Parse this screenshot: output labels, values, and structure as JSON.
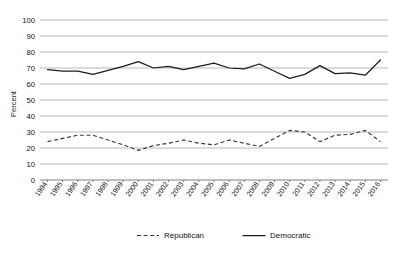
{
  "chart_data": {
    "type": "line",
    "title": "",
    "xlabel": "",
    "ylabel": "Percent",
    "ylim": [
      0,
      100
    ],
    "ytick_step": 10,
    "yticks": [
      "0",
      "10",
      "20",
      "30",
      "40",
      "50",
      "60",
      "70",
      "80",
      "90",
      "100"
    ],
    "grid": true,
    "legend_position": "bottom",
    "categories": [
      "1994",
      "1995",
      "1996",
      "1997",
      "1998",
      "1999",
      "2000",
      "2001",
      "2002",
      "2003",
      "2004",
      "2005",
      "2006",
      "2007",
      "2008",
      "2009",
      "2010",
      "2011",
      "2012",
      "2013",
      "2014",
      "2015",
      "2016"
    ],
    "series": [
      {
        "name": "Republican",
        "style": "dashed",
        "color": "#3a3a3a",
        "values": [
          24,
          26,
          28,
          28,
          25,
          22,
          18.5,
          21.5,
          23,
          25,
          23,
          22,
          25,
          23,
          21,
          26,
          31,
          30,
          24,
          28,
          28.5,
          31,
          24
        ]
      },
      {
        "name": "Democratic",
        "style": "solid",
        "color": "#1c1c1c",
        "values": [
          69,
          68,
          68,
          66,
          68.5,
          71,
          74,
          70,
          71,
          69,
          71,
          73,
          70,
          69.5,
          72.5,
          68,
          63.5,
          66,
          71.5,
          66.5,
          67,
          65.5,
          75
        ]
      }
    ]
  },
  "legend": {
    "items": [
      {
        "label": "Republican",
        "style": "dashed"
      },
      {
        "label": "Democratic",
        "style": "solid"
      }
    ]
  }
}
